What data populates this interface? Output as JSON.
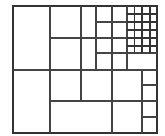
{
  "diagram": {
    "type": "recursive-rectangle-subdivision",
    "colors": {
      "background": "#ffffff",
      "line": "#444444",
      "border": "#333333"
    },
    "outer": {
      "x": 13,
      "y": 6,
      "w": 144,
      "h": 127
    },
    "lines": [
      {
        "id": "h-mid",
        "x1": 13,
        "y1": 70,
        "x2": 157,
        "y2": 70
      },
      {
        "id": "v-50",
        "x1": 50,
        "y1": 6,
        "x2": 50,
        "y2": 133
      },
      {
        "id": "top-h-38",
        "x1": 50,
        "y1": 38,
        "x2": 127,
        "y2": 38
      },
      {
        "id": "top-v-81",
        "x1": 81,
        "y1": 6,
        "x2": 81,
        "y2": 70
      },
      {
        "id": "top-v-96",
        "x1": 96,
        "y1": 6,
        "x2": 96,
        "y2": 70
      },
      {
        "id": "top-v-112",
        "x1": 112,
        "y1": 6,
        "x2": 112,
        "y2": 70
      },
      {
        "id": "top-v-127",
        "x1": 127,
        "y1": 6,
        "x2": 127,
        "y2": 70
      },
      {
        "id": "top-h-22",
        "x1": 96,
        "y1": 22,
        "x2": 127,
        "y2": 22
      },
      {
        "id": "top-h-53",
        "x1": 96,
        "y1": 53,
        "x2": 157,
        "y2": 53
      },
      {
        "id": "bot-v-81",
        "x1": 81,
        "y1": 70,
        "x2": 81,
        "y2": 101
      },
      {
        "id": "bot-h-101",
        "x1": 50,
        "y1": 101,
        "x2": 157,
        "y2": 101
      },
      {
        "id": "bot-v-112",
        "x1": 112,
        "y1": 70,
        "x2": 112,
        "y2": 133
      },
      {
        "id": "bot-v-142",
        "x1": 142,
        "y1": 70,
        "x2": 142,
        "y2": 133
      },
      {
        "id": "bot-h-85",
        "x1": 142,
        "y1": 85,
        "x2": 157,
        "y2": 85
      },
      {
        "id": "bot-h-117",
        "x1": 142,
        "y1": 117,
        "x2": 157,
        "y2": 117
      }
    ],
    "grid": {
      "x": 127,
      "y": 6,
      "w": 30,
      "h": 47,
      "cols": 4,
      "rows": 6,
      "col_lines": [
        134.5,
        142,
        150
      ],
      "row_lines": [
        14,
        22,
        30,
        38,
        46
      ]
    }
  }
}
